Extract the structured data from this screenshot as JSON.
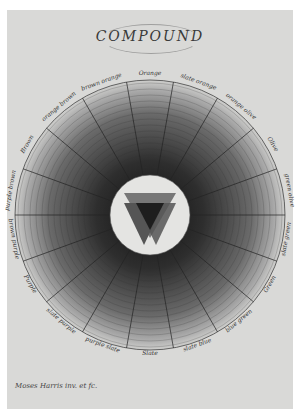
{
  "plate": {
    "title": "COMPOUND",
    "credit": "Moses Harris inv. et fc.",
    "segments": [
      "Orange",
      "slate orange",
      "orange olive",
      "Olive",
      "green olive",
      "slate green",
      "Green",
      "blue green",
      "slate blue",
      "Slate",
      "purple slate",
      "slate purple",
      "Purple",
      "brown purple",
      "purple brown",
      "Brown",
      "orange brown",
      "brown orange"
    ],
    "colors": {
      "paper": "#d9d9d7",
      "center_disc": "#e4e4e2",
      "triangle_dark": "#1e1e1e",
      "triangle_mid": "#555555",
      "triangle_light": "#777777"
    }
  }
}
